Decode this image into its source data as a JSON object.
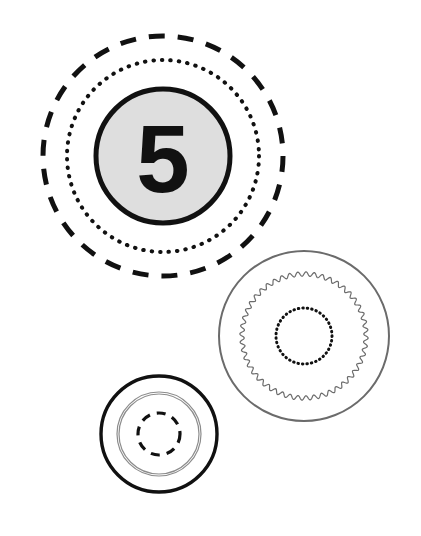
{
  "canvas": {
    "width": 421,
    "height": 536,
    "background_color": "#ffffff",
    "title": "Three Concentric Ring Diagrams"
  },
  "palette": {
    "stroke_dark": "#111111",
    "stroke_grey": "#6b6b6b",
    "stroke_light_grey": "#8c8c8c",
    "fill_grey": "#dedede",
    "background": "#ffffff"
  },
  "figures": [
    {
      "id": "numbered-badge-group",
      "name": "numbered-badge-group",
      "center": {
        "x": 163,
        "y": 156
      },
      "label": "5",
      "label_font_size": 96,
      "rings": [
        {
          "id": "outer-dashed-ring",
          "name": "outer-dashed-ring",
          "style": "dashed",
          "radius": 120,
          "stroke_width": 5,
          "stroke_color": "#111111",
          "dash_pattern": "16 13"
        },
        {
          "id": "middle-dotted-ring",
          "name": "middle-dotted-ring",
          "style": "dotted",
          "radius": 96,
          "stroke_width": 4,
          "stroke_color": "#111111",
          "dash_pattern": "0.5 8"
        },
        {
          "id": "inner-filled-disc",
          "name": "inner-filled-disc",
          "style": "solid-filled",
          "radius": 67,
          "stroke_width": 5,
          "stroke_color": "#111111",
          "fill_color": "#dedede"
        }
      ]
    },
    {
      "id": "scalloped-plate-group",
      "name": "scalloped-plate-group",
      "center": {
        "x": 304,
        "y": 336
      },
      "label": "",
      "rings": [
        {
          "id": "outer-thin-ring",
          "name": "outer-thin-ring",
          "style": "solid",
          "radius": 85,
          "stroke_width": 2,
          "stroke_color": "#6b6b6b"
        },
        {
          "id": "scalloped-wavy-ring",
          "name": "scalloped-wavy-ring",
          "style": "wavy",
          "radius": 62,
          "stroke_width": 1.2,
          "stroke_color": "#6b6b6b",
          "wave_count": 48,
          "wave_amplitude": 2.2
        },
        {
          "id": "inner-dotted-ring",
          "name": "inner-dotted-ring",
          "style": "dotted",
          "radius": 28,
          "stroke_width": 3,
          "stroke_color": "#111111",
          "dash_pattern": "0.5 4"
        }
      ]
    },
    {
      "id": "small-ring-group",
      "name": "small-ring-group",
      "center": {
        "x": 159,
        "y": 434
      },
      "label": "",
      "rings": [
        {
          "id": "outer-bold-ring",
          "name": "outer-bold-ring",
          "style": "solid",
          "radius": 58,
          "stroke_width": 3.4,
          "stroke_color": "#111111"
        },
        {
          "id": "middle-thin-ring",
          "name": "middle-thin-ring",
          "style": "solid",
          "radius": 42,
          "stroke_width": 1.2,
          "stroke_color": "#8c8c8c"
        },
        {
          "id": "middle-thin-ring-inner",
          "name": "middle-thin-ring-inner",
          "style": "solid",
          "radius": 40,
          "stroke_width": 1.2,
          "stroke_color": "#8c8c8c"
        },
        {
          "id": "inner-dashed-ring",
          "name": "inner-dashed-ring",
          "style": "dashed",
          "radius": 21,
          "stroke_width": 3.2,
          "stroke_color": "#111111",
          "dash_pattern": "9 7"
        }
      ]
    }
  ]
}
